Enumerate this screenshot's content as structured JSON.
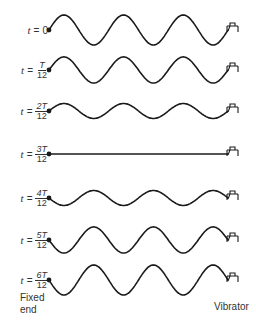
{
  "diagram": {
    "type": "standing-wave-snapshots",
    "rows": [
      {
        "t": "t",
        "eq": "=",
        "value": "0",
        "fraction": false,
        "amplitude": 1.0,
        "center_y": 30
      },
      {
        "t": "t",
        "eq": "=",
        "num": "T",
        "den": "12",
        "fraction": true,
        "amplitude": 0.87,
        "center_y": 70
      },
      {
        "t": "t",
        "eq": "=",
        "num": "2T",
        "den": "12",
        "fraction": true,
        "amplitude": 0.5,
        "center_y": 111
      },
      {
        "t": "t",
        "eq": "=",
        "num": "3T",
        "den": "12",
        "fraction": true,
        "amplitude": 0.0,
        "center_y": 154
      },
      {
        "t": "t",
        "eq": "=",
        "num": "4T",
        "den": "12",
        "fraction": true,
        "amplitude": -0.5,
        "center_y": 198
      },
      {
        "t": "t",
        "eq": "=",
        "num": "5T",
        "den": "12",
        "fraction": true,
        "amplitude": -0.87,
        "center_y": 240
      },
      {
        "t": "t",
        "eq": "=",
        "num": "6T",
        "den": "12",
        "fraction": true,
        "amplitude": -1.0,
        "center_y": 280
      }
    ],
    "labels": {
      "fixed_end_line1": "Fixed",
      "fixed_end_line2": "end",
      "vibrator": "Vibrator"
    },
    "colors": {
      "line": "#1a1a1a",
      "text": "#333333"
    }
  }
}
